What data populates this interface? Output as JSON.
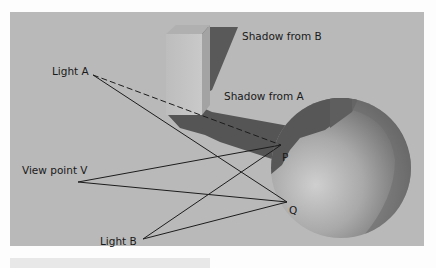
{
  "diagram": {
    "type": "shadow-and-reflection illustration",
    "colors": {
      "page": "#fdfdfd",
      "panel": "#b9b9b9",
      "shadow": "#555555",
      "box_front": "#c4c4c4",
      "box_side": "#a6a6a6",
      "sphere_light": "#c8c8c8",
      "sphere_dark": "#6a6a6a",
      "lines": "#1c1c1c"
    },
    "labels": {
      "shadow_b": "Shadow from B",
      "shadow_a": "Shadow from A",
      "light_a": "Light A",
      "view_point": "View point V",
      "light_b": "Light B",
      "point_p": "P",
      "point_q": "Q"
    },
    "points": {
      "light_a": [
        93,
        75
      ],
      "view_v": [
        78,
        182
      ],
      "light_b": [
        143,
        239
      ],
      "p": [
        281,
        145
      ],
      "q": [
        287,
        202
      ]
    }
  }
}
